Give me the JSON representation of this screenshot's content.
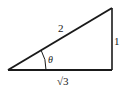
{
  "diagram": {
    "type": "right-triangle",
    "labels": {
      "hypotenuse": "2",
      "opposite": "1",
      "adjacent": "√3",
      "angle": "θ"
    },
    "colors": {
      "stroke": "#1a1a1a",
      "background": "#ffffff"
    }
  }
}
